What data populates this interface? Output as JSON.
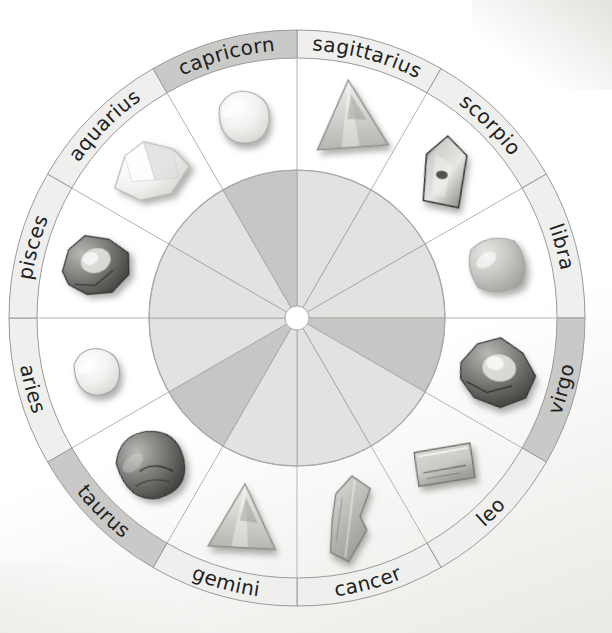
{
  "figure": {
    "type": "radial-wheel",
    "sector_count": 12,
    "colors": {
      "ring_light": "#efefed",
      "ring_dark": "#c9c9c7",
      "ring_stroke": "#9a9a98",
      "wedge_light": "#e2e2e0",
      "wedge_dark": "#c6c6c4",
      "wedge_stroke": "#a8a8a6",
      "spoke_stroke": "#b4b4b2",
      "hub_fill": "#ffffff",
      "label_color": "#20201e",
      "background": "#ffffff"
    },
    "geometry": {
      "center_x": 297,
      "center_y": 318,
      "outer_radius": 288,
      "ring_inner_radius": 260,
      "inner_disc_radius": 148,
      "hub_radius": 12,
      "start_angle_deg": -90,
      "sector_span_deg": 30
    }
  },
  "chart_data": {
    "type": "pie",
    "categories": [
      "sagittarius",
      "scorpio",
      "libra",
      "virgo",
      "leo",
      "cancer",
      "gemini",
      "taurus",
      "aries",
      "pisces",
      "aquarius",
      "capricorn"
    ],
    "values": [
      30,
      30,
      30,
      30,
      30,
      30,
      30,
      30,
      30,
      30,
      30,
      30
    ],
    "xlabel": "",
    "ylabel": "",
    "legend": "none",
    "grid": false
  },
  "wheel": {
    "sectors": [
      {
        "label": "sagittarius",
        "index": 0,
        "start_deg": 0,
        "end_deg": 30,
        "band_shade": "light",
        "wedge_shade": "light",
        "stone": {
          "name": "pyramid-crystal",
          "shape": "triangle",
          "tone": "light",
          "size": 74,
          "rotation": -4
        }
      },
      {
        "label": "scorpio",
        "index": 1,
        "start_deg": 30,
        "end_deg": 60,
        "band_shade": "light",
        "wedge_shade": "light",
        "stone": {
          "name": "terminated-point-crystal",
          "shape": "point",
          "tone": "dark",
          "size": 70,
          "rotation": 6
        }
      },
      {
        "label": "libra",
        "index": 2,
        "start_deg": 60,
        "end_deg": 90,
        "band_shade": "light",
        "wedge_shade": "light",
        "stone": {
          "name": "tumbled-stone",
          "shape": "rounded-square",
          "tone": "mid",
          "size": 66,
          "rotation": -10
        }
      },
      {
        "label": "virgo",
        "index": 3,
        "start_deg": 90,
        "end_deg": 120,
        "band_shade": "dark",
        "wedge_shade": "dark",
        "stone": {
          "name": "druzy-matrix-rock",
          "shape": "rough",
          "tone": "dark",
          "size": 80,
          "rotation": 8
        }
      },
      {
        "label": "leo",
        "index": 4,
        "start_deg": 120,
        "end_deg": 150,
        "band_shade": "light",
        "wedge_shade": "light",
        "stone": {
          "name": "polished-slab",
          "shape": "rectangle",
          "tone": "light",
          "size": 62,
          "rotation": -6
        }
      },
      {
        "label": "cancer",
        "index": 5,
        "start_deg": 150,
        "end_deg": 180,
        "band_shade": "light",
        "wedge_shade": "light",
        "stone": {
          "name": "blade-crystal",
          "shape": "blade",
          "tone": "mid",
          "size": 86,
          "rotation": 12
        }
      },
      {
        "label": "gemini",
        "index": 6,
        "start_deg": 180,
        "end_deg": 210,
        "band_shade": "light",
        "wedge_shade": "light",
        "stone": {
          "name": "pyramid-crystal",
          "shape": "triangle",
          "tone": "light",
          "size": 70,
          "rotation": 3
        }
      },
      {
        "label": "taurus",
        "index": 7,
        "start_deg": 210,
        "end_deg": 240,
        "band_shade": "dark",
        "wedge_shade": "dark",
        "stone": {
          "name": "tumbled-stone",
          "shape": "blob",
          "tone": "dark",
          "size": 76,
          "rotation": -14
        }
      },
      {
        "label": "aries",
        "index": 8,
        "start_deg": 240,
        "end_deg": 270,
        "band_shade": "light",
        "wedge_shade": "light",
        "stone": {
          "name": "tumbled-stone",
          "shape": "blob",
          "tone": "white",
          "size": 52,
          "rotation": 0
        }
      },
      {
        "label": "pisces",
        "index": 9,
        "start_deg": 270,
        "end_deg": 300,
        "band_shade": "light",
        "wedge_shade": "light",
        "stone": {
          "name": "rough-stone",
          "shape": "rough",
          "tone": "dark",
          "size": 72,
          "rotation": -18
        }
      },
      {
        "label": "aquarius",
        "index": 10,
        "start_deg": 300,
        "end_deg": 330,
        "band_shade": "light",
        "wedge_shade": "light",
        "stone": {
          "name": "angular-crystal",
          "shape": "angular",
          "tone": "white",
          "size": 82,
          "rotation": -20
        }
      },
      {
        "label": "capricorn",
        "index": 11,
        "start_deg": 330,
        "end_deg": 360,
        "band_shade": "dark",
        "wedge_shade": "dark",
        "stone": {
          "name": "tumbled-stone",
          "shape": "blob",
          "tone": "white",
          "size": 58,
          "rotation": 6
        }
      }
    ]
  }
}
